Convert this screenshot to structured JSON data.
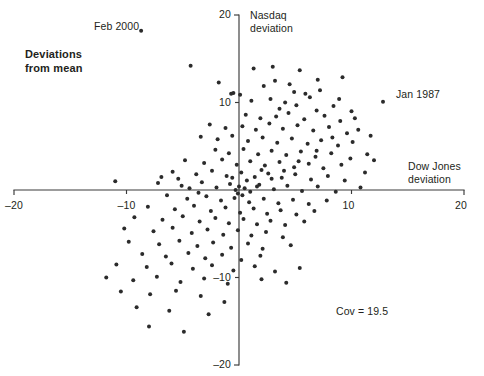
{
  "figure": {
    "title_line1": "Deviations",
    "title_line2": "from mean",
    "covariance_note": "Cov = 19.5"
  },
  "annotations": [
    {
      "label": "Feb 2000",
      "x": -8.7,
      "y": 18.2
    },
    {
      "label": "Jan 1987",
      "x": 12.8,
      "y": 10.1
    }
  ],
  "chart_data": {
    "type": "scatter",
    "title": "Deviations from mean",
    "xlabel": "Dow Jones deviation",
    "ylabel": "Nasdaq deviation",
    "xlim": [
      -20,
      20
    ],
    "ylim": [
      -20,
      20
    ],
    "xticks": [
      -20,
      -10,
      0,
      10,
      20
    ],
    "xtick_labels": [
      "–20",
      "–10",
      "",
      "10",
      "20"
    ],
    "yticks": [
      -20,
      -10,
      0,
      10,
      20
    ],
    "ytick_labels": [
      "–20",
      "–10",
      "",
      "10",
      "20"
    ],
    "grid": false,
    "legend": null,
    "axes_style": "centered-cross",
    "covariance": 19.5,
    "annotations": [
      {
        "label": "Feb 2000",
        "x": -8.7,
        "y": 18.2
      },
      {
        "label": "Jan 1987",
        "x": 12.8,
        "y": 10.1
      }
    ],
    "series": [
      {
        "name": "Monthly deviations (Dow Jones vs Nasdaq)",
        "marker": "circle",
        "color": "#2b2b2b",
        "points": [
          [
            -8.7,
            18.2
          ],
          [
            12.8,
            10.1
          ],
          [
            -4.3,
            14.2
          ],
          [
            -1.8,
            12.3
          ],
          [
            -0.5,
            11.1
          ],
          [
            -0.7,
            11.0
          ],
          [
            0.1,
            10.9
          ],
          [
            1.3,
            13.9
          ],
          [
            3.0,
            14.1
          ],
          [
            5.4,
            13.7
          ],
          [
            2.2,
            11.9
          ],
          [
            4.5,
            12.1
          ],
          [
            7.0,
            12.6
          ],
          [
            9.2,
            12.9
          ],
          [
            1.1,
            10.2
          ],
          [
            2.8,
            10.4
          ],
          [
            4.9,
            11.2
          ],
          [
            6.3,
            10.6
          ],
          [
            3.6,
            9.3
          ],
          [
            5.1,
            9.7
          ],
          [
            6.9,
            9.1
          ],
          [
            8.4,
            9.6
          ],
          [
            0.6,
            8.6
          ],
          [
            1.9,
            8.2
          ],
          [
            3.3,
            8.4
          ],
          [
            4.4,
            8.8
          ],
          [
            5.8,
            8.1
          ],
          [
            7.6,
            8.5
          ],
          [
            9.0,
            7.9
          ],
          [
            10.3,
            8.2
          ],
          [
            -2.6,
            7.5
          ],
          [
            -1.2,
            7.1
          ],
          [
            0.3,
            7.3
          ],
          [
            1.5,
            6.9
          ],
          [
            2.7,
            7.6
          ],
          [
            3.9,
            7.0
          ],
          [
            5.2,
            7.4
          ],
          [
            6.6,
            6.8
          ],
          [
            8.0,
            7.2
          ],
          [
            9.6,
            6.5
          ],
          [
            -3.4,
            6.1
          ],
          [
            -1.9,
            5.8
          ],
          [
            -0.6,
            6.2
          ],
          [
            0.8,
            5.6
          ],
          [
            2.1,
            6.0
          ],
          [
            3.4,
            5.4
          ],
          [
            4.7,
            5.9
          ],
          [
            6.1,
            5.3
          ],
          [
            7.3,
            5.7
          ],
          [
            8.8,
            5.1
          ],
          [
            10.1,
            5.5
          ],
          [
            -2.1,
            4.6
          ],
          [
            -0.9,
            4.2
          ],
          [
            0.4,
            4.7
          ],
          [
            1.7,
            4.1
          ],
          [
            2.9,
            4.5
          ],
          [
            4.2,
            4.0
          ],
          [
            5.5,
            4.4
          ],
          [
            6.8,
            3.8
          ],
          [
            8.2,
            4.2
          ],
          [
            9.9,
            3.6
          ],
          [
            11.4,
            4.1
          ],
          [
            -4.8,
            3.4
          ],
          [
            -3.1,
            3.1
          ],
          [
            -1.5,
            3.5
          ],
          [
            -0.2,
            2.9
          ],
          [
            1.0,
            3.3
          ],
          [
            2.3,
            2.8
          ],
          [
            3.6,
            3.2
          ],
          [
            4.9,
            2.6
          ],
          [
            6.2,
            3.0
          ],
          [
            7.5,
            2.5
          ],
          [
            9.1,
            2.9
          ],
          [
            -5.9,
            2.1
          ],
          [
            -3.8,
            1.8
          ],
          [
            -2.4,
            2.2
          ],
          [
            -1.1,
            1.6
          ],
          [
            0.2,
            2.0
          ],
          [
            1.4,
            1.5
          ],
          [
            2.6,
            1.9
          ],
          [
            3.8,
            1.4
          ],
          [
            5.0,
            1.8
          ],
          [
            6.4,
            1.2
          ],
          [
            7.9,
            1.6
          ],
          [
            9.4,
            1.1
          ],
          [
            -11.0,
            1.0
          ],
          [
            -7.2,
            0.8
          ],
          [
            -5.1,
            0.5
          ],
          [
            -3.3,
            0.9
          ],
          [
            -2.0,
            0.3
          ],
          [
            -0.8,
            0.7
          ],
          [
            0.5,
            0.2
          ],
          [
            1.8,
            0.6
          ],
          [
            3.1,
            0.1
          ],
          [
            4.3,
            0.5
          ],
          [
            5.6,
            -0.1
          ],
          [
            7.0,
            0.4
          ],
          [
            8.6,
            -0.2
          ],
          [
            10.8,
            0.3
          ],
          [
            -0.3,
            0.0
          ],
          [
            -0.1,
            -0.4
          ],
          [
            0.3,
            -0.6
          ],
          [
            0.0,
            0.4
          ],
          [
            -6.4,
            -0.6
          ],
          [
            -4.6,
            -1.0
          ],
          [
            -2.9,
            -0.7
          ],
          [
            -1.6,
            -1.2
          ],
          [
            -0.4,
            -0.9
          ],
          [
            0.9,
            -1.4
          ],
          [
            2.2,
            -1.0
          ],
          [
            3.5,
            -1.5
          ],
          [
            4.8,
            -1.1
          ],
          [
            6.2,
            -1.6
          ],
          [
            7.8,
            -1.2
          ],
          [
            -8.1,
            -1.9
          ],
          [
            -5.7,
            -2.2
          ],
          [
            -4.0,
            -1.8
          ],
          [
            -2.5,
            -2.4
          ],
          [
            -1.2,
            -2.0
          ],
          [
            0.1,
            -2.6
          ],
          [
            1.3,
            -2.1
          ],
          [
            2.5,
            -2.7
          ],
          [
            3.7,
            -2.3
          ],
          [
            5.1,
            -2.8
          ],
          [
            6.7,
            -2.4
          ],
          [
            -9.3,
            -3.1
          ],
          [
            -6.8,
            -3.4
          ],
          [
            -5.0,
            -3.0
          ],
          [
            -3.5,
            -3.6
          ],
          [
            -2.1,
            -3.2
          ],
          [
            -0.9,
            -3.8
          ],
          [
            0.4,
            -3.3
          ],
          [
            1.6,
            -3.9
          ],
          [
            2.8,
            -3.5
          ],
          [
            4.1,
            -4.0
          ],
          [
            5.8,
            -3.6
          ],
          [
            -10.2,
            -4.4
          ],
          [
            -7.6,
            -4.7
          ],
          [
            -5.9,
            -4.3
          ],
          [
            -4.2,
            -4.9
          ],
          [
            -2.8,
            -4.5
          ],
          [
            -1.4,
            -5.1
          ],
          [
            -0.1,
            -4.6
          ],
          [
            1.1,
            -5.2
          ],
          [
            2.4,
            -4.8
          ],
          [
            3.9,
            -5.4
          ],
          [
            -9.8,
            -5.9
          ],
          [
            -7.1,
            -6.2
          ],
          [
            -5.3,
            -5.8
          ],
          [
            -3.7,
            -6.4
          ],
          [
            -2.3,
            -6.0
          ],
          [
            -0.7,
            -6.6
          ],
          [
            0.8,
            -6.1
          ],
          [
            2.1,
            -6.7
          ],
          [
            4.6,
            -6.3
          ],
          [
            -8.6,
            -7.3
          ],
          [
            -6.5,
            -7.6
          ],
          [
            -4.5,
            -7.2
          ],
          [
            -3.0,
            -7.8
          ],
          [
            -1.5,
            -7.4
          ],
          [
            0.2,
            -8.0
          ],
          [
            1.9,
            -7.5
          ],
          [
            -10.9,
            -8.5
          ],
          [
            -8.2,
            -8.8
          ],
          [
            -6.0,
            -8.4
          ],
          [
            -4.1,
            -9.0
          ],
          [
            -2.4,
            -8.6
          ],
          [
            -0.5,
            -9.2
          ],
          [
            1.4,
            -8.7
          ],
          [
            3.2,
            -9.3
          ],
          [
            5.4,
            -8.9
          ],
          [
            -11.8,
            -10.0
          ],
          [
            -9.4,
            -10.3
          ],
          [
            -7.3,
            -9.9
          ],
          [
            -5.2,
            -10.5
          ],
          [
            -3.1,
            -10.1
          ],
          [
            -1.0,
            -10.7
          ],
          [
            2.0,
            -10.2
          ],
          [
            4.2,
            -10.6
          ],
          [
            -10.5,
            -11.6
          ],
          [
            -7.9,
            -11.9
          ],
          [
            -5.6,
            -11.5
          ],
          [
            -3.4,
            -12.1
          ],
          [
            -1.3,
            -12.8
          ],
          [
            -9.1,
            -13.4
          ],
          [
            -6.2,
            -13.8
          ],
          [
            -2.7,
            -14.2
          ],
          [
            -8.0,
            -15.6
          ],
          [
            -4.9,
            -16.2
          ],
          [
            -4.4,
            0.2
          ],
          [
            -3.6,
            -0.3
          ],
          [
            -5.4,
            1.3
          ],
          [
            -6.9,
            1.5
          ],
          [
            1.0,
            -0.2
          ],
          [
            1.6,
            0.4
          ],
          [
            0.7,
            1.1
          ],
          [
            -0.6,
            1.4
          ],
          [
            2.0,
            2.3
          ],
          [
            2.9,
            1.3
          ],
          [
            4.0,
            2.2
          ],
          [
            5.3,
            3.3
          ],
          [
            6.9,
            4.5
          ],
          [
            8.3,
            6.0
          ],
          [
            10.6,
            6.9
          ],
          [
            11.2,
            2.0
          ],
          [
            12.0,
            3.4
          ],
          [
            11.7,
            6.2
          ],
          [
            10.0,
            9.0
          ],
          [
            8.9,
            10.4
          ],
          [
            7.2,
            11.4
          ],
          [
            5.9,
            11.0
          ],
          [
            4.1,
            10.0
          ],
          [
            3.2,
            12.5
          ]
        ]
      }
    ]
  },
  "axis": {
    "x_title": "Dow Jones\ndeviation",
    "x_title_line1": "Dow Jones",
    "x_title_line2": "deviation",
    "y_title_line1": "Nasdaq",
    "y_title_line2": "deviation",
    "x_tick_labels": [
      {
        "text": "–20",
        "value": -20
      },
      {
        "text": "–10",
        "value": -10
      },
      {
        "text": "10",
        "value": 10
      },
      {
        "text": "20",
        "value": 20
      }
    ],
    "y_tick_labels": [
      {
        "text": "20",
        "value": 20
      },
      {
        "text": "10",
        "value": 10
      },
      {
        "text": "–10",
        "value": -10
      },
      {
        "text": "–20",
        "value": -20
      }
    ]
  }
}
